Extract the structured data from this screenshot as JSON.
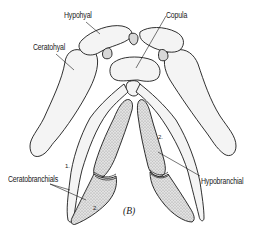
{
  "figure": {
    "panel_label": "(B)"
  },
  "labels": {
    "hypohyal": "Hypohyal",
    "copula": "Copula",
    "ceratohyal": "Ceratohyal",
    "ceratobranchials": "Ceratobranchials",
    "hypobranchial": "Hypobranchial"
  },
  "numbers": {
    "ceratobranchial_1": "1.",
    "ceratobranchial_2": "2.",
    "hypobranchial_2": "2."
  },
  "colors": {
    "ink": "#1a1a1a",
    "bone_fill": "#f4f4f4",
    "background": "#ffffff"
  }
}
